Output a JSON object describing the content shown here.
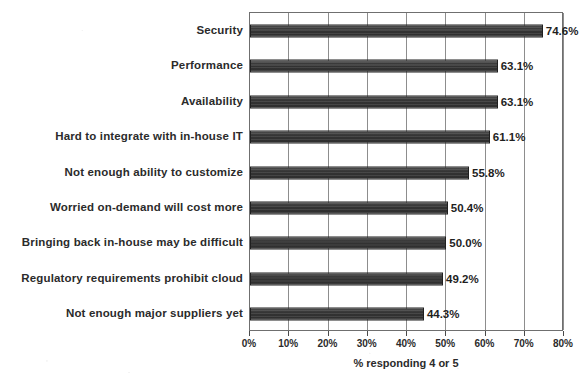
{
  "chart_data": {
    "type": "bar",
    "orientation": "horizontal",
    "title": "",
    "xlabel": "% responding 4 or 5",
    "ylabel": "",
    "xlim": [
      0,
      80
    ],
    "xticks": [
      0,
      10,
      20,
      30,
      40,
      50,
      60,
      70,
      80
    ],
    "xtick_labels": [
      "0%",
      "10%",
      "20%",
      "30%",
      "40%",
      "50%",
      "60%",
      "70%",
      "80%"
    ],
    "grid": true,
    "legend": null,
    "bar_color": "#333333",
    "categories": [
      "Security",
      "Performance",
      "Availability",
      "Hard to integrate with in-house IT",
      "Not enough ability to customize",
      "Worried on-demand will cost more",
      "Bringing back in-house may be difficult",
      "Regulatory requirements prohibit cloud",
      "Not enough major suppliers yet"
    ],
    "values": [
      74.6,
      63.1,
      63.1,
      61.1,
      55.8,
      50.4,
      50.0,
      49.2,
      44.3
    ],
    "data_labels": [
      "74.6%",
      "63.1%",
      "63.1%",
      "61.1%",
      "55.8%",
      "50.4%",
      "50.0%",
      "49.2%",
      "44.3%"
    ]
  }
}
